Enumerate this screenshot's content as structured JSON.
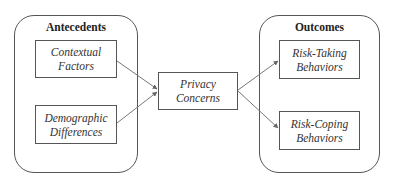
{
  "diagram": {
    "type": "flow",
    "groups": [
      {
        "id": "antecedents",
        "title": "Antecedents"
      },
      {
        "id": "outcomes",
        "title": "Outcomes"
      }
    ],
    "nodes": [
      {
        "id": "contextual",
        "group": "antecedents",
        "line1": "Contextual",
        "line2": "Factors"
      },
      {
        "id": "demographic",
        "group": "antecedents",
        "line1": "Demographic",
        "line2": "Differences"
      },
      {
        "id": "privacy",
        "group": null,
        "line1": "Privacy",
        "line2": "Concerns"
      },
      {
        "id": "risk_taking",
        "group": "outcomes",
        "line1": "Risk-Taking",
        "line2": "Behaviors"
      },
      {
        "id": "risk_coping",
        "group": "outcomes",
        "line1": "Risk-Coping",
        "line2": "Behaviors"
      }
    ],
    "edges": [
      {
        "from": "contextual",
        "to": "privacy"
      },
      {
        "from": "demographic",
        "to": "privacy"
      },
      {
        "from": "privacy",
        "to": "risk_taking"
      },
      {
        "from": "privacy",
        "to": "risk_coping"
      }
    ],
    "colors": {
      "stroke": "#555555",
      "text": "#333333",
      "background": "#ffffff"
    }
  }
}
